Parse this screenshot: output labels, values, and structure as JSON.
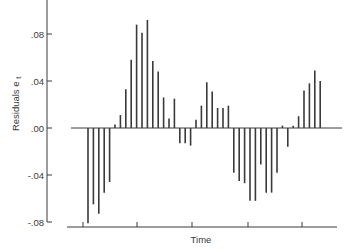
{
  "chart_data": {
    "type": "bar",
    "subtype": "stem",
    "title": "",
    "xlabel": "Time",
    "ylabel": "Residuals e",
    "ylabel_subscript": "t",
    "ylim": [
      -0.085,
      0.11
    ],
    "yticks": [
      0.08,
      0.04,
      0.0,
      -0.04,
      -0.08
    ],
    "ytick_labels": [
      ".08",
      ".04",
      ".00",
      "-.04",
      "-.08"
    ],
    "xtick_count": 5,
    "xtick_labels": [],
    "grid": false,
    "legend": null,
    "baseline": 0.0,
    "x": [
      1,
      2,
      3,
      4,
      5,
      6,
      7,
      8,
      9,
      10,
      11,
      12,
      13,
      14,
      15,
      16,
      17,
      18,
      19,
      20,
      21,
      22,
      23,
      24,
      25,
      26,
      27,
      28,
      29,
      30,
      31,
      32,
      33,
      34,
      35,
      36,
      37,
      38,
      39,
      40,
      41,
      42,
      43,
      44
    ],
    "values": [
      -0.081,
      -0.065,
      -0.073,
      -0.055,
      -0.046,
      0.003,
      0.011,
      0.033,
      0.058,
      0.088,
      0.081,
      0.092,
      0.057,
      0.048,
      0.026,
      0.008,
      0.025,
      -0.013,
      -0.013,
      -0.015,
      0.007,
      0.019,
      0.039,
      0.031,
      0.017,
      0.017,
      0.019,
      -0.038,
      -0.045,
      -0.047,
      -0.062,
      -0.062,
      -0.031,
      -0.055,
      -0.055,
      -0.038,
      0.002,
      -0.016,
      0.002,
      0.01,
      0.032,
      0.038,
      0.049,
      0.04
    ]
  },
  "layout": {
    "y_axis_x": 47,
    "y_axis_top": 0,
    "y_axis_bottom": 222,
    "zero_y": 128,
    "px_per_unit": 1175,
    "baseline_x_start": 71,
    "baseline_x_end": 342,
    "x_axis_y": 227,
    "x_axis_x_start": 67,
    "x_axis_x_end": 337,
    "xtick_positions": [
      83,
      137,
      192,
      248,
      302
    ],
    "first_stem_x": 88,
    "stem_spacing": 5.4
  },
  "labels": {
    "xlabel": "Time",
    "ylabel_main": "Residuals e",
    "ylabel_sub": "t"
  },
  "colors": {
    "ink": "#3a3a3a",
    "background": "#ffffff"
  }
}
